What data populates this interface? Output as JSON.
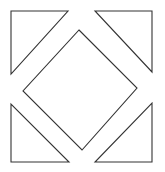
{
  "figure": {
    "background_color": "#ffffff",
    "stroke_color": "#333333",
    "stroke_width": 1.1,
    "canvas": {
      "width": 165,
      "height": 172
    },
    "shapes": [
      {
        "name": "corner-triangle-top-left",
        "type": "triangle",
        "right_angle_at": "top-left",
        "points": "11,11 68,11 11,74",
        "vertices": [
          [
            11,
            11
          ],
          [
            68,
            11
          ],
          [
            11,
            74
          ]
        ]
      },
      {
        "name": "corner-triangle-top-right",
        "type": "triangle",
        "right_angle_at": "top-right",
        "points": "95,11 152,11 152,72",
        "vertices": [
          [
            95,
            11
          ],
          [
            152,
            11
          ],
          [
            152,
            72
          ]
        ]
      },
      {
        "name": "center-diamond",
        "type": "quadrilateral",
        "right_angle_at": "none",
        "points": "79,30 137,88 82,150 23,91",
        "vertices": [
          [
            79,
            30
          ],
          [
            137,
            88
          ],
          [
            82,
            150
          ],
          [
            23,
            91
          ]
        ]
      },
      {
        "name": "corner-triangle-bottom-left",
        "type": "triangle",
        "right_angle_at": "bottom-left",
        "points": "11,104 11,162 69,162",
        "vertices": [
          [
            11,
            104
          ],
          [
            11,
            162
          ],
          [
            69,
            162
          ]
        ]
      },
      {
        "name": "corner-triangle-bottom-right",
        "type": "triangle",
        "right_angle_at": "bottom-right",
        "points": "152,103 152,162 95,162",
        "vertices": [
          [
            152,
            103
          ],
          [
            152,
            162
          ],
          [
            95,
            162
          ]
        ]
      }
    ]
  }
}
